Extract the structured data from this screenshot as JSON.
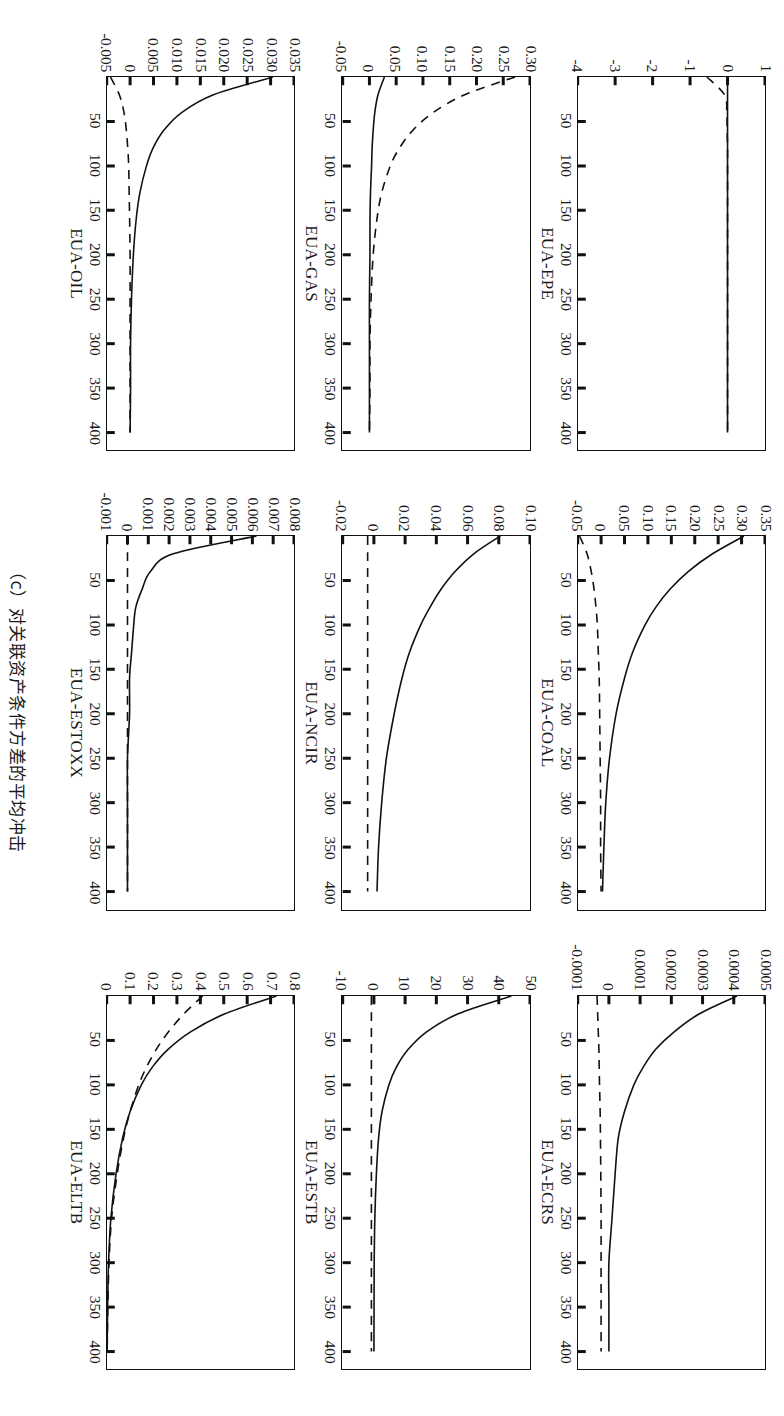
{
  "figure": {
    "caption": "（c）对关联资产条件方差的平均冲击",
    "xticks": [
      "50",
      "100",
      "150",
      "200",
      "250",
      "300",
      "350",
      "400"
    ],
    "xtick_values": [
      50,
      100,
      150,
      200,
      250,
      300,
      350,
      400
    ],
    "xlim": [
      0,
      420
    ]
  },
  "chart_data": {
    "type": "line",
    "title": "（c）对关联资产条件方差的平均冲击",
    "xlabel": "",
    "ylabel": "",
    "grid": false,
    "legend": "none",
    "x": [
      0,
      20,
      40,
      60,
      80,
      100,
      130,
      160,
      200,
      250,
      300,
      350,
      400
    ],
    "panels": [
      {
        "name": "EUA-EPE",
        "ylim": [
          -4,
          1
        ],
        "yticks": [
          "1",
          "0",
          "-1",
          "-2",
          "-3",
          "-4"
        ],
        "ytick_values": [
          1,
          0,
          -1,
          -2,
          -3,
          -4
        ],
        "series": [
          {
            "name": "solid",
            "style": "solid",
            "values": [
              0,
              0,
              0,
              0,
              0,
              0,
              0,
              0,
              0,
              0,
              0,
              0,
              0
            ]
          },
          {
            "name": "dashed",
            "style": "dashed",
            "values": [
              -0.55,
              -0.08,
              -0.02,
              -0.01,
              0,
              0,
              0,
              0,
              0,
              0,
              0,
              0,
              0
            ]
          }
        ]
      },
      {
        "name": "EUA-COAL",
        "ylim": [
          -0.05,
          0.35
        ],
        "yticks": [
          "0.35",
          "0.30",
          "0.25",
          "0.20",
          "0.15",
          "0.10",
          "0.05",
          "0",
          "-0.05"
        ],
        "ytick_values": [
          0.35,
          0.3,
          0.25,
          0.2,
          0.15,
          0.1,
          0.05,
          0,
          -0.05
        ],
        "series": [
          {
            "name": "solid",
            "style": "solid",
            "values": [
              0.305,
              0.238,
              0.186,
              0.147,
              0.117,
              0.094,
              0.068,
              0.05,
              0.032,
              0.018,
              0.01,
              0.006,
              0.003
            ]
          },
          {
            "name": "dashed",
            "style": "dashed",
            "values": [
              -0.046,
              -0.03,
              -0.021,
              -0.015,
              -0.011,
              -0.008,
              -0.006,
              -0.004,
              -0.003,
              -0.002,
              -0.001,
              -0.001,
              0
            ]
          }
        ]
      },
      {
        "name": "EUA-ECRS",
        "ylim": [
          -0.0001,
          0.0005
        ],
        "yticks": [
          "0.0005",
          "0.0004",
          "0.0003",
          "0.0002",
          "0.0001",
          "0",
          "-0.0001"
        ],
        "ytick_values": [
          0.0005,
          0.0004,
          0.0003,
          0.0002,
          0.0001,
          0,
          -0.0001
        ],
        "series": [
          {
            "name": "solid",
            "style": "solid",
            "values": [
              0.00041,
              0.00029,
              0.00021,
              0.00015,
              0.00011,
              8e-05,
              5e-05,
              3e-05,
              2e-05,
              1e-05,
              0,
              0,
              0
            ]
          },
          {
            "name": "dashed",
            "style": "dashed",
            "values": [
              -3.8e-05,
              -3.6e-05,
              -3.4e-05,
              -3.2e-05,
              -3.1e-05,
              -3e-05,
              -2.8e-05,
              -2.7e-05,
              -2.6e-05,
              -2.5e-05,
              -2.5e-05,
              -2.5e-05,
              -2.5e-05
            ]
          }
        ]
      },
      {
        "name": "EUA-GAS",
        "ylim": [
          -0.05,
          0.3
        ],
        "yticks": [
          "0.30",
          "0.25",
          "0.20",
          "0.15",
          "0.10",
          "0.05",
          "0",
          "-0.05"
        ],
        "ytick_values": [
          0.3,
          0.25,
          0.2,
          0.15,
          0.1,
          0.05,
          0,
          -0.05
        ],
        "series": [
          {
            "name": "solid",
            "style": "solid",
            "values": [
              0.028,
              0.016,
              0.01,
              0.007,
              0.005,
              0.004,
              0.002,
              0.001,
              0.001,
              0,
              0,
              0,
              0
            ]
          },
          {
            "name": "dashed",
            "style": "dashed",
            "values": [
              0.272,
              0.178,
              0.119,
              0.081,
              0.056,
              0.039,
              0.023,
              0.014,
              0.007,
              0.003,
              0.001,
              0.001,
              0
            ]
          }
        ]
      },
      {
        "name": "EUA-NCIR",
        "ylim": [
          -0.02,
          0.1
        ],
        "yticks": [
          "0.10",
          "0.08",
          "0.06",
          "0.04",
          "0.02",
          "0",
          "-0.02"
        ],
        "ytick_values": [
          0.1,
          0.08,
          0.06,
          0.04,
          0.02,
          0,
          -0.02
        ],
        "series": [
          {
            "name": "solid",
            "style": "solid",
            "values": [
              0.081,
              0.064,
              0.052,
              0.043,
              0.036,
              0.03,
              0.023,
              0.018,
              0.013,
              0.008,
              0.005,
              0.003,
              0.002
            ]
          },
          {
            "name": "dashed",
            "style": "dashed",
            "values": [
              -0.004,
              -0.004,
              -0.004,
              -0.004,
              -0.004,
              -0.004,
              -0.004,
              -0.004,
              -0.004,
              -0.004,
              -0.004,
              -0.004,
              -0.004
            ]
          }
        ]
      },
      {
        "name": "EUA-ESTB",
        "ylim": [
          -10,
          50
        ],
        "yticks": [
          "50",
          "40",
          "30",
          "20",
          "10",
          "0",
          "-10"
        ],
        "ytick_values": [
          50,
          40,
          30,
          20,
          10,
          0,
          -10
        ],
        "series": [
          {
            "name": "solid",
            "style": "solid",
            "values": [
              44.0,
              27.0,
              17.0,
              11.0,
              7.2,
              4.8,
              2.6,
              1.5,
              0.8,
              0.3,
              0.1,
              0.05,
              0.02
            ]
          },
          {
            "name": "dashed",
            "style": "dashed",
            "values": [
              -0.8,
              -0.8,
              -0.8,
              -0.8,
              -0.8,
              -0.8,
              -0.8,
              -0.8,
              -0.8,
              -0.8,
              -0.8,
              -0.8,
              -0.8
            ]
          }
        ]
      },
      {
        "name": "EUA-OIL",
        "ylim": [
          -0.005,
          0.035
        ],
        "yticks": [
          "0.035",
          "0.030",
          "0.025",
          "0.020",
          "0.015",
          "0.010",
          "0.005",
          "0",
          "-0.005"
        ],
        "ytick_values": [
          0.035,
          0.03,
          0.025,
          0.02,
          0.015,
          0.01,
          0.005,
          0,
          -0.005
        ],
        "series": [
          {
            "name": "solid",
            "style": "solid",
            "values": [
              0.0305,
              0.0178,
              0.011,
              0.0072,
              0.0049,
              0.0035,
              0.0021,
              0.0013,
              0.0007,
              0.0003,
              0.0001,
              0.0001,
              0
            ]
          },
          {
            "name": "dashed",
            "style": "dashed",
            "values": [
              -0.0042,
              -0.0023,
              -0.0013,
              -0.0008,
              -0.0005,
              -0.0003,
              -0.0002,
              -0.0001,
              0,
              0,
              0,
              0,
              0
            ]
          }
        ]
      },
      {
        "name": "EUA-ESTOXX",
        "ylim": [
          -0.001,
          0.008
        ],
        "yticks": [
          "0.008",
          "0.007",
          "0.006",
          "0.005",
          "0.004",
          "0.003",
          "0.002",
          "0.001",
          "0",
          "-0.001"
        ],
        "ytick_values": [
          0.008,
          0.007,
          0.006,
          0.005,
          0.004,
          0.003,
          0.002,
          0.001,
          0,
          -0.001
        ],
        "series": [
          {
            "name": "solid",
            "style": "solid",
            "values": [
              0.0062,
              0.0022,
              0.0011,
              0.0007,
              0.0004,
              0.0003,
              0.0002,
              0.0001,
              0.0001,
              0,
              0,
              0,
              0
            ]
          },
          {
            "name": "dashed",
            "style": "dashed",
            "values": [
              0,
              0,
              0,
              0,
              0,
              0,
              0,
              0,
              0,
              0,
              0,
              0,
              0
            ]
          }
        ]
      },
      {
        "name": "EUA-ELTB",
        "ylim": [
          0,
          0.8
        ],
        "yticks": [
          "0.8",
          "0.7",
          "0.6",
          "0.5",
          "0.4",
          "0.3",
          "0.2",
          "0.1",
          "0"
        ],
        "ytick_values": [
          0.8,
          0.7,
          0.6,
          0.5,
          0.4,
          0.3,
          0.2,
          0.1,
          0
        ],
        "series": [
          {
            "name": "solid",
            "style": "solid",
            "values": [
              0.725,
              0.505,
              0.36,
              0.262,
              0.195,
              0.148,
              0.1,
              0.068,
              0.04,
              0.018,
              0.008,
              0.004,
              0.002
            ]
          },
          {
            "name": "dashed",
            "style": "dashed",
            "values": [
              0.41,
              0.33,
              0.265,
              0.212,
              0.17,
              0.137,
              0.1,
              0.072,
              0.045,
              0.021,
              0.01,
              0.005,
              0.002
            ]
          }
        ]
      }
    ]
  }
}
